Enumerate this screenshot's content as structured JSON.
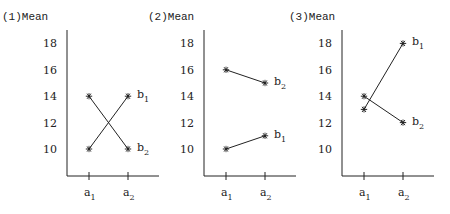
{
  "chart_data": [
    {
      "type": "line",
      "title": "(1)Mean",
      "ylabel": "Mean",
      "categories": [
        "a1",
        "a2"
      ],
      "yticks": [
        10,
        12,
        14,
        16,
        18
      ],
      "ylim": [
        8,
        19
      ],
      "series": [
        {
          "name": "b1",
          "values": [
            10,
            14
          ]
        },
        {
          "name": "b2",
          "values": [
            14,
            10
          ]
        }
      ]
    },
    {
      "type": "line",
      "title": "(2)Mean",
      "ylabel": "Mean",
      "categories": [
        "a1",
        "a2"
      ],
      "yticks": [
        10,
        12,
        14,
        16,
        18
      ],
      "ylim": [
        8,
        19
      ],
      "series": [
        {
          "name": "b1",
          "values": [
            10,
            11
          ]
        },
        {
          "name": "b2",
          "values": [
            16,
            15
          ]
        }
      ]
    },
    {
      "type": "line",
      "title": "(3)Mean",
      "ylabel": "Mean",
      "categories": [
        "a1",
        "a2"
      ],
      "yticks": [
        10,
        12,
        14,
        16,
        18
      ],
      "ylim": [
        8,
        19
      ],
      "series": [
        {
          "name": "b1",
          "values": [
            13,
            18
          ]
        },
        {
          "name": "b2",
          "values": [
            14,
            12
          ]
        }
      ]
    }
  ]
}
